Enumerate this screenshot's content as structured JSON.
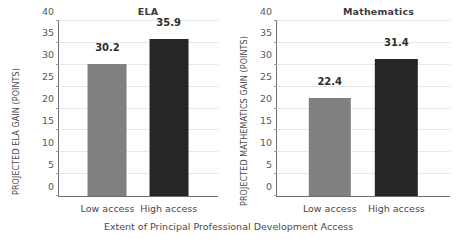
{
  "figure": {
    "xlabel": "Extent of Principal Professional Development Access"
  },
  "chart_data": [
    {
      "type": "bar",
      "title": "ELA",
      "xlabel": "Extent of Principal Professional Development Access",
      "ylabel": "PROJECTED ELA GAIN (POINTS)",
      "categories": [
        "Low access",
        "High access"
      ],
      "values": [
        30.2,
        35.9
      ],
      "value_labels": [
        "30.2",
        "35.9"
      ],
      "bar_colors": [
        "#808080",
        "#262626"
      ],
      "ylim": [
        0,
        40
      ],
      "yticks": [
        0,
        5,
        10,
        15,
        20,
        25,
        30,
        35,
        40
      ],
      "ytick_labels": [
        "0",
        "5",
        "10",
        "15",
        "20",
        "25",
        "30",
        "35",
        "40"
      ],
      "grid": true,
      "legend": false
    },
    {
      "type": "bar",
      "title": "Mathematics",
      "xlabel": "Extent of Principal Professional Development Access",
      "ylabel": "PROJECTED MATHEMATICS GAIN (POINTS)",
      "categories": [
        "Low access",
        "High access"
      ],
      "values": [
        22.4,
        31.4
      ],
      "value_labels": [
        "22.4",
        "31.4"
      ],
      "bar_colors": [
        "#808080",
        "#262626"
      ],
      "ylim": [
        0,
        40
      ],
      "yticks": [
        0,
        5,
        10,
        15,
        20,
        25,
        30,
        35,
        40
      ],
      "ytick_labels": [
        "0",
        "5",
        "10",
        "15",
        "20",
        "25",
        "30",
        "35",
        "40"
      ],
      "grid": true,
      "legend": false
    }
  ]
}
